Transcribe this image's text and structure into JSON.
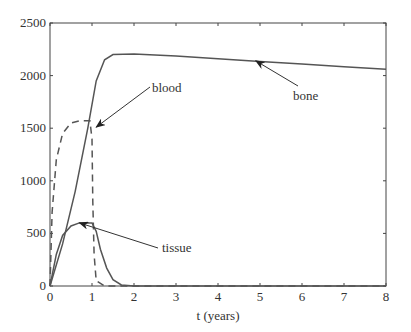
{
  "chart_data": {
    "type": "line",
    "title": "",
    "xlabel": "t (years)",
    "ylabel": "",
    "xlim": [
      0,
      8
    ],
    "ylim": [
      0,
      2500
    ],
    "grid": false,
    "legend": null,
    "x_ticks": [
      "0",
      "1",
      "2",
      "3",
      "4",
      "5",
      "6",
      "7",
      "8"
    ],
    "y_ticks": [
      "0",
      "500",
      "1000",
      "1500",
      "2000",
      "2500"
    ],
    "series": [
      {
        "name": "bone",
        "style": "solid",
        "points": [
          [
            0,
            0
          ],
          [
            0.3,
            400
          ],
          [
            0.6,
            900
          ],
          [
            0.9,
            1500
          ],
          [
            1.1,
            1950
          ],
          [
            1.3,
            2150
          ],
          [
            1.5,
            2200
          ],
          [
            2,
            2205
          ],
          [
            3,
            2185
          ],
          [
            4,
            2160
          ],
          [
            5,
            2135
          ],
          [
            6,
            2110
          ],
          [
            7,
            2085
          ],
          [
            8,
            2060
          ]
        ]
      },
      {
        "name": "blood",
        "style": "dashed",
        "points": [
          [
            0,
            0
          ],
          [
            0.05,
            700
          ],
          [
            0.15,
            1200
          ],
          [
            0.3,
            1450
          ],
          [
            0.5,
            1550
          ],
          [
            0.7,
            1570
          ],
          [
            0.95,
            1570
          ],
          [
            1.0,
            1400
          ],
          [
            1.02,
            800
          ],
          [
            1.05,
            300
          ],
          [
            1.1,
            50
          ],
          [
            1.3,
            0
          ],
          [
            8,
            0
          ]
        ]
      },
      {
        "name": "tissue",
        "style": "solid",
        "points": [
          [
            0,
            0
          ],
          [
            0.15,
            300
          ],
          [
            0.3,
            480
          ],
          [
            0.5,
            570
          ],
          [
            0.7,
            600
          ],
          [
            1.0,
            600
          ],
          [
            1.1,
            520
          ],
          [
            1.2,
            350
          ],
          [
            1.35,
            170
          ],
          [
            1.5,
            60
          ],
          [
            1.7,
            10
          ],
          [
            2,
            0
          ],
          [
            8,
            0
          ]
        ]
      }
    ],
    "annotations": [
      {
        "text": "bone",
        "arrow_to": [
          4.9,
          2140
        ]
      },
      {
        "text": "blood",
        "arrow_to": [
          1.1,
          1510
        ]
      },
      {
        "text": "tissue",
        "arrow_to": [
          0.7,
          600
        ]
      }
    ]
  },
  "labels": {
    "xlabel": "t (years)",
    "bone": "bone",
    "blood": "blood",
    "tissue": "tissue"
  }
}
